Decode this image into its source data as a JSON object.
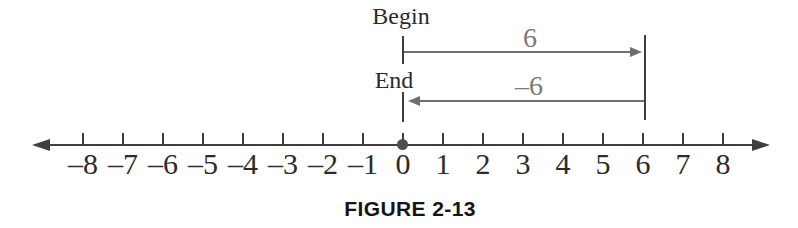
{
  "figure": {
    "caption": "FIGURE 2-13"
  },
  "markers": {
    "begin_label": "Begin",
    "end_label": "End"
  },
  "displacements": {
    "forward": {
      "label": "6",
      "from": 0,
      "to": 6,
      "direction": "right"
    },
    "backward": {
      "label": "–6",
      "from": 6,
      "to": 0,
      "direction": "left"
    }
  },
  "number_line": {
    "min": -8,
    "max": 8,
    "origin_dot_value": 0,
    "end_bar_value": 6,
    "ticks": [
      {
        "value": -8,
        "label": "–8"
      },
      {
        "value": -7,
        "label": "–7"
      },
      {
        "value": -6,
        "label": "–6"
      },
      {
        "value": -5,
        "label": "–5"
      },
      {
        "value": -4,
        "label": "–4"
      },
      {
        "value": -3,
        "label": "–3"
      },
      {
        "value": -2,
        "label": "–2"
      },
      {
        "value": -1,
        "label": "–1"
      },
      {
        "value": 0,
        "label": "0"
      },
      {
        "value": 1,
        "label": "1"
      },
      {
        "value": 2,
        "label": "2"
      },
      {
        "value": 3,
        "label": "3"
      },
      {
        "value": 4,
        "label": "4"
      },
      {
        "value": 5,
        "label": "5"
      },
      {
        "value": 6,
        "label": "6"
      },
      {
        "value": 7,
        "label": "7"
      },
      {
        "value": 8,
        "label": "8"
      }
    ]
  },
  "colors": {
    "line": "#3f3f3f",
    "arrow": "#6f6f6f",
    "text": "#2b2b2b",
    "label_gray": "#7a7a7a",
    "dot": "#4e4e4e",
    "caption": "#151515",
    "background": "#ffffff"
  }
}
